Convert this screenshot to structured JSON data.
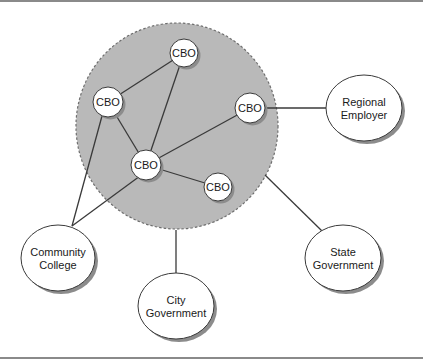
{
  "diagram": {
    "colors": {
      "cluster_fill": "#b9b9b9",
      "cluster_border": "#6e6e6e",
      "node_fill": "#ffffff",
      "node_stroke": "#3a3a3a",
      "shadow": "#8c8c8c",
      "edge": "#3a3a3a",
      "rule": "#8a8a8a"
    },
    "cluster": {
      "cx": 177,
      "cy": 126,
      "rx": 101,
      "ry": 103,
      "style": "dashed"
    },
    "cbo_nodes": [
      {
        "id": "cbo-top",
        "label": "CBO",
        "cx": 184,
        "cy": 53,
        "r": 14
      },
      {
        "id": "cbo-left",
        "label": "CBO",
        "cx": 108,
        "cy": 102,
        "r": 15
      },
      {
        "id": "cbo-right",
        "label": "CBO",
        "cx": 250,
        "cy": 108,
        "r": 15
      },
      {
        "id": "cbo-center",
        "label": "CBO",
        "cx": 146,
        "cy": 165,
        "r": 15
      },
      {
        "id": "cbo-bottom-right",
        "label": "CBO",
        "cx": 218,
        "cy": 187,
        "r": 14
      }
    ],
    "entities": [
      {
        "id": "regional-employer",
        "lines": [
          "Regional",
          "Employer"
        ],
        "cx": 364,
        "cy": 108,
        "rx": 38,
        "ry": 33
      },
      {
        "id": "community-college",
        "lines": [
          "Community",
          "College"
        ],
        "cx": 58,
        "cy": 258,
        "rx": 37,
        "ry": 33
      },
      {
        "id": "city-government",
        "lines": [
          "City",
          "Government"
        ],
        "cx": 176,
        "cy": 306,
        "rx": 38,
        "ry": 33
      },
      {
        "id": "state-government",
        "lines": [
          "State",
          "Government"
        ],
        "cx": 343,
        "cy": 258,
        "rx": 38,
        "ry": 33
      }
    ],
    "edges": [
      {
        "from": "cbo-top",
        "to": "cbo-left",
        "x1": 184,
        "y1": 53,
        "x2": 108,
        "y2": 102
      },
      {
        "from": "cbo-top",
        "to": "cbo-center",
        "x1": 184,
        "y1": 53,
        "x2": 146,
        "y2": 165
      },
      {
        "from": "cbo-left",
        "to": "cbo-center",
        "x1": 108,
        "y1": 102,
        "x2": 146,
        "y2": 165
      },
      {
        "from": "cbo-right",
        "to": "cbo-center",
        "x1": 250,
        "y1": 108,
        "x2": 146,
        "y2": 165
      },
      {
        "from": "cbo-center",
        "to": "cbo-bottom-right",
        "x1": 146,
        "y1": 165,
        "x2": 218,
        "y2": 187
      },
      {
        "from": "cbo-left",
        "to": "community-college",
        "x1": 102,
        "y1": 116,
        "x2": 72,
        "y2": 226
      },
      {
        "from": "cbo-center",
        "to": "community-college",
        "x1": 140,
        "y1": 176,
        "x2": 72,
        "y2": 226
      },
      {
        "from": "cbo-right",
        "to": "regional-employer",
        "x1": 265,
        "y1": 108,
        "x2": 326,
        "y2": 108
      },
      {
        "from": "cluster",
        "to": "city-government",
        "x1": 176,
        "y1": 230,
        "x2": 176,
        "y2": 273
      },
      {
        "from": "cluster",
        "to": "state-government",
        "x1": 265,
        "y1": 175,
        "x2": 322,
        "y2": 231
      }
    ]
  }
}
